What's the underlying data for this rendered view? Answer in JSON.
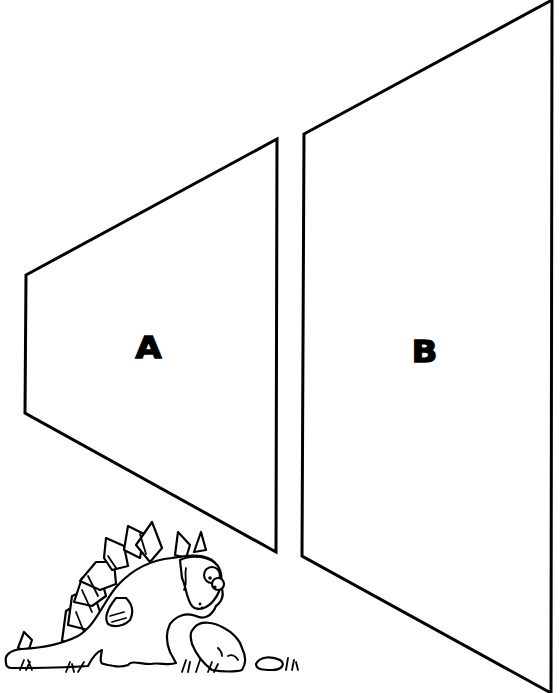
{
  "illustration": {
    "title": "",
    "background_color": "#ffffff",
    "line_color": "#000000",
    "shapes": [
      {
        "id": "A",
        "label": "A",
        "type": "trapezoid",
        "points": [
          [
            26,
            275
          ],
          [
            277,
            139
          ],
          [
            276,
            552
          ],
          [
            25,
            413
          ]
        ]
      },
      {
        "id": "B",
        "label": "B",
        "type": "trapezoid",
        "points": [
          [
            304,
            134
          ],
          [
            552,
            0
          ],
          [
            551,
            693
          ],
          [
            302,
            556
          ]
        ]
      }
    ],
    "decoration": {
      "subject": "cartoon stegosaurus sniffing a rock",
      "position": "bottom-left"
    }
  }
}
